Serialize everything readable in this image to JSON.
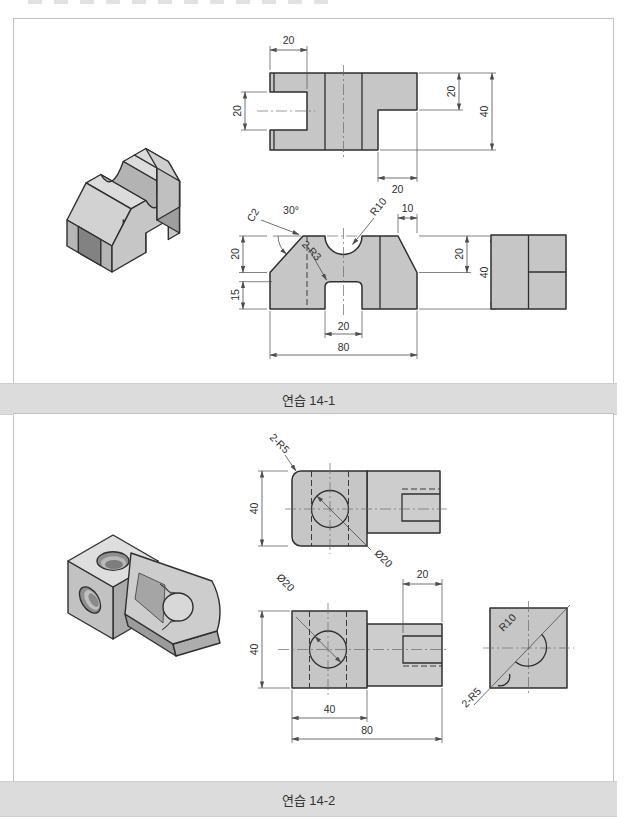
{
  "colors": {
    "caption_bg": "#dcdcdc",
    "panel_border": "#c2c2c2",
    "part_fill": "#c6c6c6",
    "outline": "#2f2f2f",
    "dim_line": "#4d4d4d"
  },
  "exercise1": {
    "caption": "연습 14-1",
    "top_view": {
      "seg_width": "20",
      "slot_height": "20",
      "right_height": "20",
      "total_height": "40",
      "step_width": "20"
    },
    "front_view": {
      "angle": "30°",
      "chamfer": "C2",
      "radius": "R10",
      "top_right": "10",
      "left_upper": "20",
      "left_lower": "15",
      "right_upper": "20",
      "right_total": "40",
      "fillets": "2-R3",
      "slot_width": "20",
      "total_width": "80"
    }
  },
  "exercise2": {
    "caption": "연습 14-2",
    "top_view": {
      "fillets": "2-R5",
      "height": "40",
      "hole": "Ø20"
    },
    "front_view": {
      "hole": "Ø20",
      "slot_width": "20",
      "height": "40",
      "square_width": "40",
      "total_width": "80"
    },
    "side_view": {
      "radius": "R10",
      "fillets": "2-R5"
    }
  }
}
